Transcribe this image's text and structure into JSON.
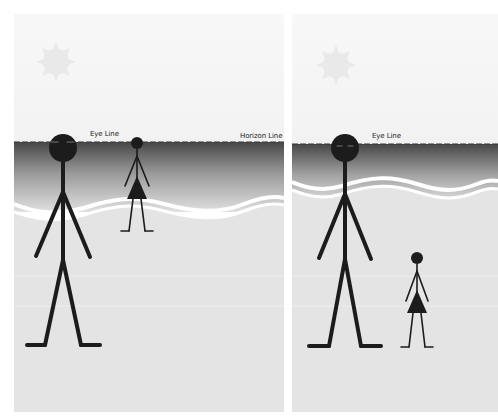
{
  "colors": {
    "sky_top": "#f7f7f7",
    "sky_bottom": "#f3f3f3",
    "sea_top": "#4a4a4a",
    "sea_bottom": "#e2e2e2",
    "ground": "#e4e4e4",
    "wave": "#ffffff",
    "sun": "#e9e9e9",
    "figure": "#1c1c1c",
    "label_text": "#222222"
  },
  "panels": [
    {
      "id": "left",
      "labels": {
        "eye_line": "Eye Line",
        "horizon_line": "Horizon Line"
      },
      "horizon_y": 128,
      "figures": [
        {
          "name": "tall-man",
          "kind": "man",
          "head_on_eye_line": true
        },
        {
          "name": "small-woman",
          "kind": "woman",
          "head_on_eye_line": true
        }
      ]
    },
    {
      "id": "right",
      "labels": {
        "eye_line": "Eye Line"
      },
      "horizon_y": 130,
      "figures": [
        {
          "name": "tall-man",
          "kind": "man",
          "head_on_eye_line": true
        },
        {
          "name": "small-woman",
          "kind": "woman",
          "head_on_eye_line": false
        }
      ]
    }
  ]
}
